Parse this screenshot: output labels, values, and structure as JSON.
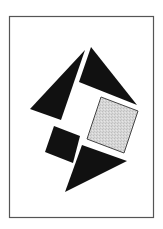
{
  "figure": {
    "width": 163,
    "height": 229,
    "background": "#ffffff",
    "frame": {
      "x": 9.5,
      "y": 16.5,
      "width": 144,
      "height": 201,
      "stroke": "#555555",
      "stroke_width": 1.2
    },
    "shapes": [
      {
        "id": "left-triangle",
        "type": "triangle",
        "fill": "#111111",
        "points": "85,50 30,109 61,120"
      },
      {
        "id": "right-triangle",
        "type": "triangle",
        "fill": "#111111",
        "points": "91,47 79,82 137,105"
      },
      {
        "id": "gray-square",
        "type": "square",
        "fill": "#d4d4d4",
        "stroke": "#444444",
        "points": "101,97 138,111 124,153 87,139"
      },
      {
        "id": "black-square",
        "type": "square",
        "fill": "#111111",
        "points": "54,126 80,136 73,163 45,152"
      },
      {
        "id": "bottom-triangle",
        "type": "triangle",
        "fill": "#111111",
        "points": "82,145 127,161 65,192"
      }
    ]
  }
}
